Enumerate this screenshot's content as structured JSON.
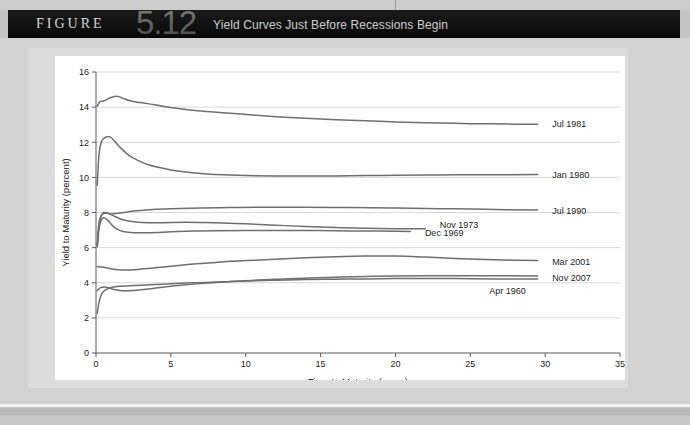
{
  "figure": {
    "word": "FIGURE",
    "number": "5.12",
    "title": "Yield Curves Just Before Recessions Begin"
  },
  "chart_data": {
    "type": "line",
    "title": "Yield Curves Just Before Recessions Begin",
    "xlabel": "Time to Maturity (years)",
    "ylabel": "Yield to Maturity (percent)",
    "xlim": [
      0,
      35
    ],
    "ylim": [
      0,
      16
    ],
    "xticks": [
      0,
      5,
      10,
      15,
      20,
      25,
      30,
      35
    ],
    "yticks": [
      0,
      2,
      4,
      6,
      8,
      10,
      12,
      14,
      16
    ],
    "grid": "horizontal",
    "legend": "inline-right-of-curve-ends",
    "line_color": "#6f6f6f",
    "series": [
      {
        "name": "Jul 1981",
        "label_x": 30.2,
        "label_y": 13.05,
        "points": [
          [
            0.08,
            14.05
          ],
          [
            0.25,
            14.3
          ],
          [
            0.5,
            14.35
          ],
          [
            0.75,
            14.45
          ],
          [
            1.0,
            14.55
          ],
          [
            1.4,
            14.62
          ],
          [
            1.8,
            14.5
          ],
          [
            2.2,
            14.38
          ],
          [
            2.6,
            14.3
          ],
          [
            3.0,
            14.26
          ],
          [
            4.0,
            14.12
          ],
          [
            5.0,
            13.98
          ],
          [
            7.0,
            13.78
          ],
          [
            10.0,
            13.58
          ],
          [
            12.0,
            13.45
          ],
          [
            15.0,
            13.32
          ],
          [
            18.0,
            13.22
          ],
          [
            20.0,
            13.16
          ],
          [
            22.0,
            13.11
          ],
          [
            25.0,
            13.06
          ],
          [
            28.0,
            13.03
          ],
          [
            29.5,
            13.02
          ]
        ]
      },
      {
        "name": "Jan 1980",
        "label_x": 30.2,
        "label_y": 10.15,
        "points": [
          [
            0.08,
            9.55
          ],
          [
            0.2,
            11.3
          ],
          [
            0.35,
            12.0
          ],
          [
            0.5,
            12.2
          ],
          [
            0.7,
            12.3
          ],
          [
            0.9,
            12.32
          ],
          [
            1.1,
            12.2
          ],
          [
            1.4,
            11.9
          ],
          [
            1.8,
            11.55
          ],
          [
            2.2,
            11.25
          ],
          [
            2.6,
            11.05
          ],
          [
            3.0,
            10.88
          ],
          [
            3.5,
            10.72
          ],
          [
            4.0,
            10.6
          ],
          [
            5.0,
            10.42
          ],
          [
            6.0,
            10.3
          ],
          [
            7.0,
            10.22
          ],
          [
            8.0,
            10.16
          ],
          [
            10.0,
            10.1
          ],
          [
            12.0,
            10.08
          ],
          [
            15.0,
            10.08
          ],
          [
            18.0,
            10.1
          ],
          [
            20.0,
            10.12
          ],
          [
            23.0,
            10.14
          ],
          [
            26.0,
            10.15
          ],
          [
            29.5,
            10.16
          ]
        ]
      },
      {
        "name": "Jul 1990",
        "label_x": 30.2,
        "label_y": 8.12,
        "points": [
          [
            0.08,
            6.1
          ],
          [
            0.18,
            7.3
          ],
          [
            0.3,
            7.75
          ],
          [
            0.45,
            7.92
          ],
          [
            0.6,
            7.96
          ],
          [
            0.8,
            7.95
          ],
          [
            1.0,
            7.92
          ],
          [
            1.5,
            7.96
          ],
          [
            2.0,
            8.02
          ],
          [
            2.5,
            8.08
          ],
          [
            3.0,
            8.12
          ],
          [
            4.0,
            8.18
          ],
          [
            5.0,
            8.22
          ],
          [
            7.0,
            8.26
          ],
          [
            9.0,
            8.28
          ],
          [
            11.0,
            8.3
          ],
          [
            14.0,
            8.3
          ],
          [
            17.0,
            8.28
          ],
          [
            20.0,
            8.26
          ],
          [
            23.0,
            8.22
          ],
          [
            26.0,
            8.18
          ],
          [
            29.5,
            8.14
          ]
        ]
      },
      {
        "name": "Nov 1973",
        "label_x": 22.7,
        "label_y": 7.28,
        "points": [
          [
            0.08,
            6.05
          ],
          [
            0.2,
            7.2
          ],
          [
            0.32,
            7.75
          ],
          [
            0.45,
            7.95
          ],
          [
            0.6,
            8.0
          ],
          [
            0.8,
            7.96
          ],
          [
            1.0,
            7.88
          ],
          [
            1.3,
            7.76
          ],
          [
            1.7,
            7.62
          ],
          [
            2.2,
            7.52
          ],
          [
            2.8,
            7.45
          ],
          [
            3.5,
            7.42
          ],
          [
            4.5,
            7.42
          ],
          [
            6.0,
            7.44
          ],
          [
            8.0,
            7.42
          ],
          [
            10.0,
            7.36
          ],
          [
            12.0,
            7.28
          ],
          [
            14.0,
            7.2
          ],
          [
            16.0,
            7.14
          ],
          [
            18.0,
            7.1
          ],
          [
            20.0,
            7.08
          ],
          [
            22.0,
            7.08
          ]
        ]
      },
      {
        "name": "Dec 1969",
        "label_x": 21.7,
        "label_y": 6.85,
        "points": [
          [
            0.08,
            6.05
          ],
          [
            0.2,
            7.1
          ],
          [
            0.35,
            7.58
          ],
          [
            0.5,
            7.7
          ],
          [
            0.7,
            7.62
          ],
          [
            0.9,
            7.45
          ],
          [
            1.1,
            7.25
          ],
          [
            1.4,
            7.05
          ],
          [
            1.8,
            6.92
          ],
          [
            2.3,
            6.86
          ],
          [
            3.0,
            6.84
          ],
          [
            4.0,
            6.86
          ],
          [
            5.0,
            6.9
          ],
          [
            6.5,
            6.94
          ],
          [
            8.0,
            6.96
          ],
          [
            10.0,
            6.98
          ],
          [
            13.0,
            6.98
          ],
          [
            16.0,
            6.96
          ],
          [
            19.0,
            6.94
          ],
          [
            21.0,
            6.92
          ]
        ]
      },
      {
        "name": "Mar 2001",
        "label_x": 30.2,
        "label_y": 5.22,
        "points": [
          [
            0.08,
            4.92
          ],
          [
            0.5,
            4.88
          ],
          [
            1.0,
            4.8
          ],
          [
            1.5,
            4.74
          ],
          [
            2.0,
            4.72
          ],
          [
            2.5,
            4.74
          ],
          [
            3.0,
            4.78
          ],
          [
            4.0,
            4.86
          ],
          [
            5.0,
            4.94
          ],
          [
            6.0,
            5.02
          ],
          [
            7.0,
            5.1
          ],
          [
            8.0,
            5.16
          ],
          [
            9.0,
            5.22
          ],
          [
            10.0,
            5.26
          ],
          [
            12.0,
            5.34
          ],
          [
            14.0,
            5.42
          ],
          [
            16.0,
            5.48
          ],
          [
            18.0,
            5.52
          ],
          [
            20.0,
            5.52
          ],
          [
            22.0,
            5.46
          ],
          [
            24.0,
            5.38
          ],
          [
            26.0,
            5.32
          ],
          [
            28.0,
            5.28
          ],
          [
            29.5,
            5.26
          ]
        ]
      },
      {
        "name": "Nov 2007",
        "label_x": 30.2,
        "label_y": 4.28,
        "points": [
          [
            0.08,
            3.55
          ],
          [
            0.3,
            3.72
          ],
          [
            0.6,
            3.76
          ],
          [
            0.9,
            3.7
          ],
          [
            1.2,
            3.62
          ],
          [
            1.6,
            3.56
          ],
          [
            2.0,
            3.54
          ],
          [
            2.5,
            3.56
          ],
          [
            3.0,
            3.6
          ],
          [
            4.0,
            3.7
          ],
          [
            5.0,
            3.8
          ],
          [
            6.0,
            3.88
          ],
          [
            7.0,
            3.96
          ],
          [
            8.0,
            4.02
          ],
          [
            10.0,
            4.12
          ],
          [
            12.0,
            4.2
          ],
          [
            14.0,
            4.26
          ],
          [
            16.0,
            4.32
          ],
          [
            18.0,
            4.36
          ],
          [
            20.0,
            4.38
          ],
          [
            23.0,
            4.4
          ],
          [
            26.0,
            4.4
          ],
          [
            29.5,
            4.38
          ]
        ]
      },
      {
        "name": "Apr 1960",
        "label_x": 26.0,
        "label_y": 3.52,
        "points": [
          [
            0.08,
            2.25
          ],
          [
            0.2,
            2.9
          ],
          [
            0.35,
            3.3
          ],
          [
            0.5,
            3.5
          ],
          [
            0.7,
            3.62
          ],
          [
            0.9,
            3.7
          ],
          [
            1.2,
            3.76
          ],
          [
            1.6,
            3.8
          ],
          [
            2.0,
            3.82
          ],
          [
            2.5,
            3.84
          ],
          [
            3.0,
            3.86
          ],
          [
            4.0,
            3.9
          ],
          [
            5.0,
            3.94
          ],
          [
            6.0,
            3.98
          ],
          [
            8.0,
            4.04
          ],
          [
            10.0,
            4.1
          ],
          [
            12.0,
            4.14
          ],
          [
            14.0,
            4.18
          ],
          [
            16.0,
            4.2
          ],
          [
            18.0,
            4.22
          ],
          [
            21.0,
            4.24
          ],
          [
            24.0,
            4.24
          ],
          [
            27.0,
            4.22
          ],
          [
            29.5,
            4.22
          ]
        ]
      }
    ]
  }
}
